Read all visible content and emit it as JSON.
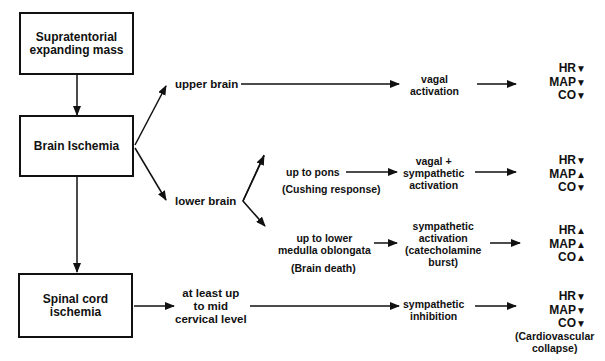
{
  "boxes": {
    "supratentorial": "Supratentorial expanding mass",
    "brain_ischemia": "Brain Ischemia",
    "spinal_cord": "Spinal cord ischemia"
  },
  "labels": {
    "upper_brain": "upper brain",
    "lower_brain": "lower brain",
    "up_to_pons": "up to pons",
    "cushing": "(Cushing  response)",
    "medulla_1": "up to lower",
    "medulla_2": "medulla  oblongata",
    "brain_death": "(Brain  death)",
    "cervical_1": "at least up",
    "cervical_2": "to mid",
    "cervical_3": "cervical level"
  },
  "mechanisms": {
    "vagal_1": "vagal",
    "vagal_2": "activation",
    "vs_1": "vagal +",
    "vs_2": "sympathetic",
    "vs_3": "activation",
    "sa_1": "sympathetic",
    "sa_2": "activation",
    "sa_3": "(catecholamine",
    "sa_4": "burst)",
    "si_1": "sympathetic",
    "si_2": "inhibition"
  },
  "outcomes": [
    {
      "rows": [
        {
          "k": "HR",
          "dir": "down",
          "sym": "▼"
        },
        {
          "k": "MAP",
          "dir": "down",
          "sym": "▼"
        },
        {
          "k": "CO",
          "dir": "down",
          "sym": "▼"
        }
      ]
    },
    {
      "rows": [
        {
          "k": "HR",
          "dir": "down",
          "sym": "▼"
        },
        {
          "k": "MAP",
          "dir": "up",
          "sym": "▲"
        },
        {
          "k": "CO",
          "dir": "down",
          "sym": "▼"
        }
      ]
    },
    {
      "rows": [
        {
          "k": "HR",
          "dir": "up",
          "sym": "▲"
        },
        {
          "k": "MAP",
          "dir": "up",
          "sym": "▲"
        },
        {
          "k": "CO",
          "dir": "up",
          "sym": "▲"
        }
      ]
    },
    {
      "rows": [
        {
          "k": "HR",
          "dir": "down",
          "sym": "▼"
        },
        {
          "k": "MAP",
          "dir": "down",
          "sym": "▼"
        },
        {
          "k": "CO",
          "dir": "down",
          "sym": "▼"
        }
      ]
    }
  ],
  "collapse": {
    "l1": "(Cardiovascular",
    "l2": "collapse)"
  }
}
